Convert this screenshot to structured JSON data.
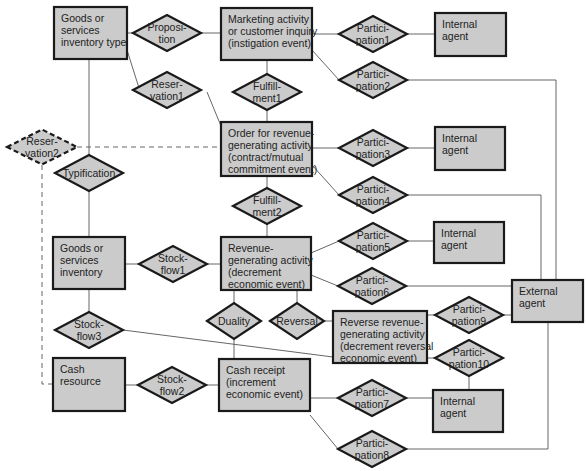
{
  "diagram": {
    "type": "REA entity-relationship diagram",
    "entities": [
      {
        "id": "goods_type",
        "lines": [
          "Goods or",
          "services",
          "inventory type"
        ],
        "x": 54,
        "y": 7,
        "w": 73,
        "h": 52
      },
      {
        "id": "marketing",
        "lines": [
          "Marketing activity",
          "or customer inquiry",
          "(instigation event)"
        ],
        "x": 221,
        "y": 8,
        "w": 91,
        "h": 52
      },
      {
        "id": "internal1",
        "lines": [
          "Internal",
          "agent"
        ],
        "x": 435,
        "y": 13,
        "w": 71,
        "h": 43
      },
      {
        "id": "order",
        "lines": [
          "Order for revenue-",
          "generating activity",
          "(contract/mutual",
          "commitment event)"
        ],
        "x": 221,
        "y": 122,
        "w": 91,
        "h": 54
      },
      {
        "id": "internal2",
        "lines": [
          "Internal",
          "agent"
        ],
        "x": 435,
        "y": 127,
        "w": 70,
        "h": 43
      },
      {
        "id": "goods_inv",
        "lines": [
          "Goods or",
          "services",
          "inventory"
        ],
        "x": 53,
        "y": 237,
        "w": 72,
        "h": 52
      },
      {
        "id": "revenue",
        "lines": [
          "Revenue-",
          "generating activity",
          "(decrement",
          "economic event)"
        ],
        "x": 221,
        "y": 237,
        "w": 90,
        "h": 53
      },
      {
        "id": "internal3",
        "lines": [
          "Internal",
          "agent"
        ],
        "x": 434,
        "y": 222,
        "w": 70,
        "h": 41
      },
      {
        "id": "external",
        "lines": [
          "External",
          "agent"
        ],
        "x": 512,
        "y": 280,
        "w": 71,
        "h": 42
      },
      {
        "id": "reverse",
        "lines": [
          "Reverse revenue-",
          "generating activity",
          "(decrement reversal",
          "economic event)"
        ],
        "x": 333,
        "y": 311,
        "w": 94,
        "h": 52
      },
      {
        "id": "cash_res",
        "lines": [
          "Cash",
          "resource"
        ],
        "x": 53,
        "y": 358,
        "w": 72,
        "h": 53
      },
      {
        "id": "cash_rec",
        "lines": [
          "Cash receipt",
          "(increment",
          "economic event)"
        ],
        "x": 219,
        "y": 359,
        "w": 91,
        "h": 52
      },
      {
        "id": "internal4",
        "lines": [
          "Internal",
          "agent"
        ],
        "x": 433,
        "y": 390,
        "w": 70,
        "h": 42
      }
    ],
    "relationships": [
      {
        "id": "proposition",
        "lines": [
          "Proposi-",
          "tion"
        ],
        "cx": 167,
        "cy": 33,
        "w": 68,
        "h": 36,
        "dashed": false
      },
      {
        "id": "participation1",
        "lines": [
          "Partici-",
          "pation1"
        ],
        "cx": 373,
        "cy": 34,
        "w": 68,
        "h": 36,
        "dashed": false
      },
      {
        "id": "reservation1",
        "lines": [
          "Reser-",
          "vation1"
        ],
        "cx": 167,
        "cy": 90,
        "w": 68,
        "h": 36,
        "dashed": false
      },
      {
        "id": "fulfillment1",
        "lines": [
          "Fulfill-",
          "ment1"
        ],
        "cx": 267,
        "cy": 92,
        "w": 68,
        "h": 36,
        "dashed": false
      },
      {
        "id": "participation2",
        "lines": [
          "Partici-",
          "pation2"
        ],
        "cx": 373,
        "cy": 80,
        "w": 68,
        "h": 36,
        "dashed": false
      },
      {
        "id": "reservation2",
        "lines": [
          "Reser-",
          "vation2"
        ],
        "cx": 42,
        "cy": 147,
        "w": 70,
        "h": 35,
        "dashed": true
      },
      {
        "id": "participation3",
        "lines": [
          "Partici-",
          "pation3"
        ],
        "cx": 373,
        "cy": 148,
        "w": 68,
        "h": 36,
        "dashed": false
      },
      {
        "id": "typification",
        "lines": [
          "Typification"
        ],
        "cx": 89,
        "cy": 173,
        "w": 68,
        "h": 36,
        "dashed": false
      },
      {
        "id": "participation4",
        "lines": [
          "Partici-",
          "pation4"
        ],
        "cx": 373,
        "cy": 195,
        "w": 68,
        "h": 36,
        "dashed": false
      },
      {
        "id": "fulfillment2",
        "lines": [
          "Fulfill-",
          "ment2"
        ],
        "cx": 267,
        "cy": 206,
        "w": 68,
        "h": 36,
        "dashed": false
      },
      {
        "id": "participation5",
        "lines": [
          "Partici-",
          "pation5"
        ],
        "cx": 373,
        "cy": 241,
        "w": 68,
        "h": 36,
        "dashed": false
      },
      {
        "id": "stockflow1",
        "lines": [
          "Stock-",
          "flow1"
        ],
        "cx": 173,
        "cy": 264,
        "w": 68,
        "h": 36,
        "dashed": false
      },
      {
        "id": "participation6",
        "lines": [
          "Partici-",
          "pation6"
        ],
        "cx": 372,
        "cy": 286,
        "w": 68,
        "h": 36,
        "dashed": false
      },
      {
        "id": "duality",
        "lines": [
          "Duality"
        ],
        "cx": 234,
        "cy": 321,
        "w": 54,
        "h": 36,
        "dashed": false
      },
      {
        "id": "reversal",
        "lines": [
          "Reversal"
        ],
        "cx": 297,
        "cy": 321,
        "w": 54,
        "h": 36,
        "dashed": false
      },
      {
        "id": "participation9",
        "lines": [
          "Partici-",
          "pation9"
        ],
        "cx": 469,
        "cy": 315,
        "w": 68,
        "h": 36,
        "dashed": false
      },
      {
        "id": "stockflow3",
        "lines": [
          "Stock-",
          "flow3"
        ],
        "cx": 89,
        "cy": 330,
        "w": 68,
        "h": 36,
        "dashed": false
      },
      {
        "id": "participation10",
        "lines": [
          "Partici-",
          "pation10"
        ],
        "cx": 469,
        "cy": 358,
        "w": 68,
        "h": 36,
        "dashed": false
      },
      {
        "id": "stockflow2",
        "lines": [
          "Stock-",
          "flow2"
        ],
        "cx": 172,
        "cy": 385,
        "w": 68,
        "h": 36,
        "dashed": false
      },
      {
        "id": "participation7",
        "lines": [
          "Partici-",
          "pation7"
        ],
        "cx": 372,
        "cy": 398,
        "w": 68,
        "h": 36,
        "dashed": false
      },
      {
        "id": "participation8",
        "lines": [
          "Partici-",
          "pation8"
        ],
        "cx": 372,
        "cy": 449,
        "w": 68,
        "h": 36,
        "dashed": false
      }
    ],
    "connectors": [
      {
        "pts": [
          [
            127,
            33
          ],
          [
            133,
            33
          ]
        ]
      },
      {
        "pts": [
          [
            201,
            33
          ],
          [
            221,
            33
          ]
        ]
      },
      {
        "pts": [
          [
            312,
            34
          ],
          [
            339,
            34
          ]
        ]
      },
      {
        "pts": [
          [
            407,
            34
          ],
          [
            435,
            34
          ]
        ]
      },
      {
        "pts": [
          [
            312,
            50
          ],
          [
            339,
            80
          ]
        ]
      },
      {
        "pts": [
          [
            407,
            80
          ],
          [
            556,
            80
          ],
          [
            556,
            280
          ]
        ]
      },
      {
        "pts": [
          [
            127,
            50
          ],
          [
            139,
            88
          ]
        ]
      },
      {
        "pts": [
          [
            207,
            92
          ],
          [
            221,
            126
          ]
        ]
      },
      {
        "pts": [
          [
            267,
            60
          ],
          [
            267,
            74
          ]
        ]
      },
      {
        "pts": [
          [
            267,
            110
          ],
          [
            267,
            122
          ]
        ]
      },
      {
        "pts": [
          [
            312,
            148
          ],
          [
            339,
            148
          ]
        ]
      },
      {
        "pts": [
          [
            407,
            148
          ],
          [
            435,
            148
          ]
        ]
      },
      {
        "pts": [
          [
            312,
            165
          ],
          [
            339,
            195
          ]
        ]
      },
      {
        "pts": [
          [
            407,
            195
          ],
          [
            541,
            195
          ],
          [
            541,
            280
          ]
        ]
      },
      {
        "pts": [
          [
            89,
            59
          ],
          [
            89,
            155
          ]
        ]
      },
      {
        "pts": [
          [
            89,
            191
          ],
          [
            89,
            237
          ]
        ]
      },
      {
        "pts": [
          [
            267,
            176
          ],
          [
            267,
            188
          ]
        ]
      },
      {
        "pts": [
          [
            267,
            224
          ],
          [
            267,
            237
          ]
        ]
      },
      {
        "pts": [
          [
            125,
            264
          ],
          [
            139,
            264
          ]
        ]
      },
      {
        "pts": [
          [
            207,
            264
          ],
          [
            221,
            264
          ]
        ]
      },
      {
        "pts": [
          [
            311,
            253
          ],
          [
            339,
            241
          ]
        ]
      },
      {
        "pts": [
          [
            407,
            241
          ],
          [
            434,
            241
          ]
        ]
      },
      {
        "pts": [
          [
            311,
            275
          ],
          [
            338,
            286
          ]
        ]
      },
      {
        "pts": [
          [
            406,
            286
          ],
          [
            512,
            286
          ]
        ]
      },
      {
        "pts": [
          [
            89,
            289
          ],
          [
            89,
            312
          ]
        ]
      },
      {
        "pts": [
          [
            123,
            330
          ],
          [
            333,
            357
          ]
        ]
      },
      {
        "pts": [
          [
            234,
            290
          ],
          [
            234,
            303
          ]
        ]
      },
      {
        "pts": [
          [
            234,
            339
          ],
          [
            234,
            359
          ]
        ]
      },
      {
        "pts": [
          [
            297,
            290
          ],
          [
            297,
            303
          ]
        ]
      },
      {
        "pts": [
          [
            324,
            321
          ],
          [
            333,
            321
          ]
        ]
      },
      {
        "pts": [
          [
            427,
            315
          ],
          [
            435,
            315
          ]
        ]
      },
      {
        "pts": [
          [
            503,
            315
          ],
          [
            512,
            315
          ]
        ]
      },
      {
        "pts": [
          [
            427,
            358
          ],
          [
            435,
            358
          ]
        ]
      },
      {
        "pts": [
          [
            469,
            376
          ],
          [
            469,
            390
          ]
        ]
      },
      {
        "pts": [
          [
            125,
            385
          ],
          [
            138,
            385
          ]
        ]
      },
      {
        "pts": [
          [
            206,
            385
          ],
          [
            219,
            385
          ]
        ]
      },
      {
        "pts": [
          [
            310,
            398
          ],
          [
            338,
            398
          ]
        ]
      },
      {
        "pts": [
          [
            406,
            398
          ],
          [
            433,
            398
          ]
        ]
      },
      {
        "pts": [
          [
            310,
            415
          ],
          [
            338,
            449
          ]
        ]
      },
      {
        "pts": [
          [
            406,
            449
          ],
          [
            548,
            449
          ],
          [
            548,
            322
          ]
        ]
      }
    ],
    "dashed_connectors": [
      {
        "pts": [
          [
            77,
            147
          ],
          [
            221,
            147
          ]
        ]
      },
      {
        "pts": [
          [
            42,
            165
          ],
          [
            42,
            384
          ],
          [
            53,
            384
          ]
        ]
      }
    ]
  }
}
